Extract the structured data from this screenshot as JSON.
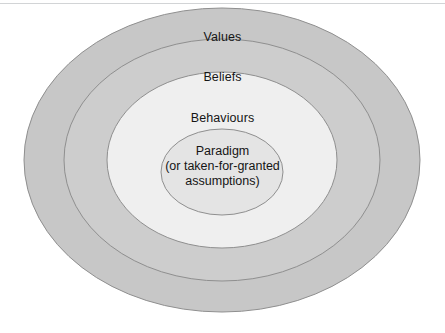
{
  "figure": {
    "type": "concentric-ellipse-diagram",
    "background_color": "#ffffff",
    "width": 445,
    "height": 333,
    "top_rule_color": "#d2d4d6"
  },
  "rings": [
    {
      "id": "values",
      "label": "Values",
      "level": 1,
      "position": "outermost",
      "fill_color": "#c7c7c7",
      "stroke_color": "#8f8f8f"
    },
    {
      "id": "beliefs",
      "label": "Beliefs",
      "level": 2,
      "position": "second",
      "fill_color": "#cdcdcd",
      "stroke_color": "#8f8f8f"
    },
    {
      "id": "behaviours",
      "label": "Behaviours",
      "level": 3,
      "position": "third",
      "fill_color": "#efefef",
      "stroke_color": "#8f8f8f"
    },
    {
      "id": "paradigm",
      "label": "Paradigm",
      "level": 4,
      "position": "innermost",
      "fill_color": "#e4e4e4",
      "stroke_color": "#8f8f8f"
    }
  ],
  "core": {
    "title": "Paradigm",
    "subtitle_line_1": "(or taken-for-granted",
    "subtitle_line_2": "assumptions)"
  }
}
